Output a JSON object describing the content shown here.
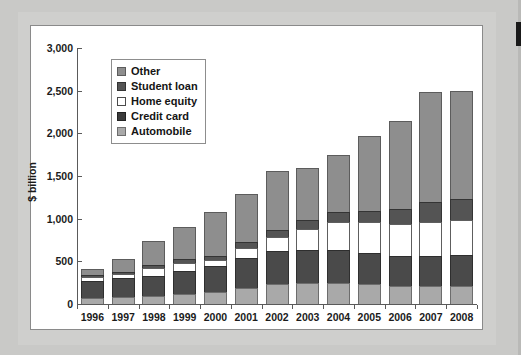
{
  "chart_data": {
    "type": "bar",
    "stacked": true,
    "title": "",
    "subtitle": "",
    "xlabel": "",
    "ylabel": "$ billion",
    "ylim": [
      0,
      3000
    ],
    "ytick_labels": [
      "3,000",
      "2,500",
      "2,000",
      "1,500",
      "1,000",
      "500",
      "0"
    ],
    "ytick_values": [
      3000,
      2500,
      2000,
      1500,
      1000,
      500,
      0
    ],
    "grid": false,
    "legend_position": "upper-left-inside",
    "categories": [
      "1996",
      "1997",
      "1998",
      "1999",
      "2000",
      "2001",
      "2002",
      "2003",
      "2004",
      "2005",
      "2006",
      "2007",
      "2008"
    ],
    "series": [
      {
        "name": "Automobile",
        "color": "#a9a9a9",
        "values": [
          75,
          80,
          95,
          115,
          135,
          190,
          235,
          245,
          245,
          230,
          215,
          215,
          210
        ]
      },
      {
        "name": "Credit card",
        "color": "#3b3b3b",
        "values": [
          200,
          220,
          230,
          275,
          310,
          355,
          385,
          390,
          385,
          365,
          350,
          350,
          365
        ]
      },
      {
        "name": "Home equity",
        "color": "#ffffff",
        "values": [
          45,
          50,
          100,
          90,
          70,
          115,
          170,
          245,
          335,
          370,
          370,
          400,
          405
        ]
      },
      {
        "name": "Student loan",
        "color": "#545454",
        "values": [
          25,
          30,
          35,
          45,
          50,
          65,
          75,
          100,
          110,
          130,
          175,
          235,
          250
        ]
      },
      {
        "name": "Other",
        "color": "#8e8e8e",
        "values": [
          65,
          150,
          275,
          380,
          515,
          570,
          690,
          615,
          670,
          880,
          1035,
          1290,
          1270
        ]
      }
    ],
    "totals": [
      410,
      530,
      735,
      905,
      1080,
      1295,
      1555,
      1595,
      1745,
      1975,
      2145,
      2490,
      2500
    ]
  },
  "legend": {
    "items": [
      {
        "label": "Other",
        "swatch": "other-swatch"
      },
      {
        "label": "Student loan",
        "swatch": "student-loan-swatch"
      },
      {
        "label": "Home equity",
        "swatch": "home-equity-swatch"
      },
      {
        "label": "Credit card",
        "swatch": "credit-card-swatch"
      },
      {
        "label": "Automobile",
        "swatch": "automobile-swatch"
      }
    ]
  },
  "colors": {
    "page_background": "#c9c9c7",
    "panel_background": "#ffffff",
    "axis": "#5a5a5a",
    "text": "#1b1b1b"
  }
}
